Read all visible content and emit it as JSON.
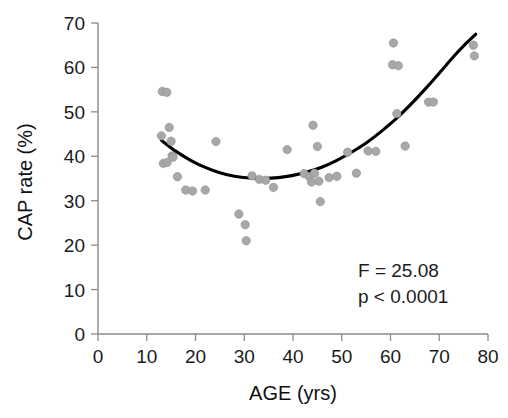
{
  "chart_data": {
    "type": "scatter",
    "title": "",
    "xlabel": "AGE (yrs)",
    "ylabel": "CAP rate (%)",
    "xlim": [
      0,
      80
    ],
    "ylim": [
      0,
      70
    ],
    "xticks": [
      0,
      10,
      20,
      30,
      40,
      50,
      60,
      70,
      80
    ],
    "yticks": [
      0,
      10,
      20,
      30,
      40,
      50,
      60,
      70
    ],
    "xtick_labels": [
      "0",
      "10",
      "20",
      "30",
      "40",
      "50",
      "60",
      "70",
      "80"
    ],
    "ytick_labels": [
      "0",
      "10",
      "20",
      "30",
      "40",
      "50",
      "60",
      "70"
    ],
    "grid": false,
    "legend": false,
    "marker_color": "#a8a8a8",
    "curve_color": "#000000",
    "axis_color": "#8a8a8a",
    "points": [
      [
        13.2,
        54.6
      ],
      [
        14.1,
        54.4
      ],
      [
        13.0,
        44.6
      ],
      [
        14.6,
        46.5
      ],
      [
        15.0,
        43.4
      ],
      [
        13.4,
        38.4
      ],
      [
        14.2,
        38.6
      ],
      [
        15.2,
        40.1
      ],
      [
        15.4,
        39.8
      ],
      [
        16.3,
        35.4
      ],
      [
        18.0,
        32.4
      ],
      [
        19.4,
        32.2
      ],
      [
        22.0,
        32.4
      ],
      [
        24.2,
        43.3
      ],
      [
        28.9,
        27.0
      ],
      [
        30.2,
        24.6
      ],
      [
        30.4,
        21.0
      ],
      [
        31.6,
        35.6
      ],
      [
        33.1,
        34.8
      ],
      [
        34.4,
        34.6
      ],
      [
        36.0,
        33.0
      ],
      [
        38.8,
        41.5
      ],
      [
        42.3,
        36.1
      ],
      [
        43.4,
        35.4
      ],
      [
        43.8,
        34.2
      ],
      [
        44.4,
        36.2
      ],
      [
        45.3,
        34.4
      ],
      [
        44.1,
        47.0
      ],
      [
        45.0,
        42.2
      ],
      [
        45.6,
        29.8
      ],
      [
        47.4,
        35.2
      ],
      [
        49.0,
        35.5
      ],
      [
        51.2,
        40.9
      ],
      [
        53.0,
        36.2
      ],
      [
        55.4,
        41.2
      ],
      [
        57.0,
        41.1
      ],
      [
        60.6,
        65.5
      ],
      [
        60.4,
        60.6
      ],
      [
        61.6,
        60.4
      ],
      [
        61.3,
        49.6
      ],
      [
        63.0,
        42.3
      ],
      [
        67.8,
        52.2
      ],
      [
        68.8,
        52.2
      ],
      [
        77.0,
        65.0
      ],
      [
        77.2,
        62.6
      ]
    ],
    "fit": {
      "type": "quadratic",
      "label": "quadratic regression fit",
      "x_start": 13.0,
      "x_end": 77.5,
      "curve_points": [
        [
          13.0,
          43.6
        ],
        [
          16.0,
          41.1
        ],
        [
          19.0,
          39.1
        ],
        [
          22.0,
          37.5
        ],
        [
          25.0,
          36.3
        ],
        [
          28.0,
          35.5
        ],
        [
          31.0,
          35.1
        ],
        [
          34.0,
          35.0
        ],
        [
          37.0,
          35.2
        ],
        [
          40.0,
          35.7
        ],
        [
          43.0,
          36.5
        ],
        [
          46.0,
          37.6
        ],
        [
          49.0,
          39.1
        ],
        [
          52.0,
          40.9
        ],
        [
          55.0,
          43.0
        ],
        [
          58.0,
          45.5
        ],
        [
          61.0,
          48.3
        ],
        [
          64.0,
          51.5
        ],
        [
          67.0,
          55.0
        ],
        [
          70.0,
          58.7
        ],
        [
          73.0,
          62.5
        ],
        [
          75.5,
          65.4
        ],
        [
          77.5,
          67.5
        ]
      ]
    },
    "annotations": [
      {
        "name": "f-statistic",
        "text": "F = 25.08"
      },
      {
        "name": "p-value",
        "text": "p < 0.0001"
      }
    ]
  }
}
